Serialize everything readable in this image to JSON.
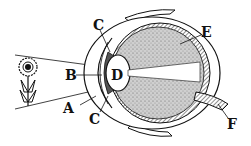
{
  "diagram": {
    "labels": {
      "A": "A",
      "B": "B",
      "C_top": "C",
      "C_bottom": "C",
      "D": "D",
      "E": "E",
      "F": "F"
    },
    "colors": {
      "ink": "#111111",
      "vitreous": "#c8c8c8",
      "background": "#ffffff"
    }
  }
}
